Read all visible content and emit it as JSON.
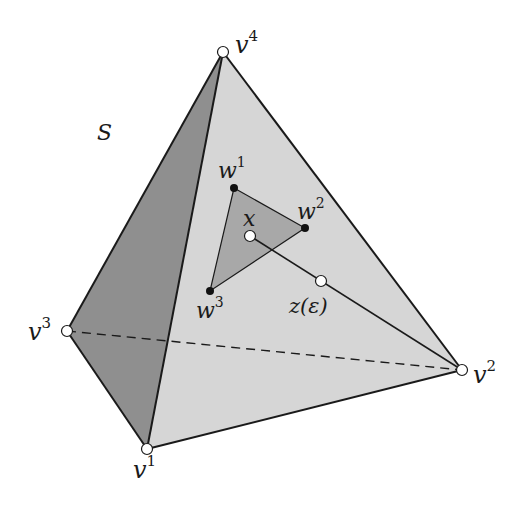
{
  "diagram": {
    "type": "simplex-tetrahedron",
    "set_label": "S",
    "colors": {
      "front_face": "#d6d6d6",
      "left_face": "#8f8f8f",
      "inner_triangle": "#a8a8a8",
      "edge": "#1a1a1a",
      "open_point_fill": "#ffffff",
      "solid_point_fill": "#111111"
    },
    "vertices": [
      {
        "id": "v1",
        "base": "v",
        "sup": "1",
        "x": 147,
        "y": 449
      },
      {
        "id": "v2",
        "base": "v",
        "sup": "2",
        "x": 462,
        "y": 370
      },
      {
        "id": "v3",
        "base": "v",
        "sup": "3",
        "x": 67,
        "y": 331
      },
      {
        "id": "v4",
        "base": "v",
        "sup": "4",
        "x": 223,
        "y": 52
      }
    ],
    "inner_points": [
      {
        "id": "w1",
        "base": "w",
        "sup": "1",
        "x": 234,
        "y": 188
      },
      {
        "id": "w2",
        "base": "w",
        "sup": "2",
        "x": 305,
        "y": 228
      },
      {
        "id": "w3",
        "base": "w",
        "sup": "3",
        "x": 210,
        "y": 291
      }
    ],
    "point_x": {
      "label": "x",
      "x": 250,
      "y": 236
    },
    "point_z": {
      "label": "z(ε)",
      "x": 321,
      "y": 281
    },
    "hidden_edge": {
      "from": "v3",
      "to": "v2",
      "style": "dashed"
    }
  }
}
